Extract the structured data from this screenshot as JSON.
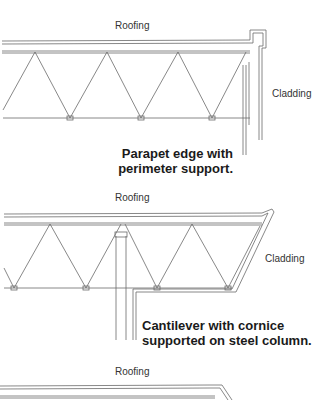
{
  "panels": [
    {
      "id": "parapet",
      "roofing_label": "Roofing",
      "cladding_label": "Cladding",
      "caption_line1": "Parapet edge with",
      "caption_line2": "perimeter support."
    },
    {
      "id": "cantilever",
      "roofing_label": "Roofing",
      "cladding_label": "Cladding",
      "caption_line1": "Cantilever with cornice",
      "caption_line2": "supported on steel column."
    },
    {
      "id": "third",
      "roofing_label": "Roofing"
    }
  ],
  "colors": {
    "line": "#6a6a6a",
    "text": "#1a1a1a"
  }
}
